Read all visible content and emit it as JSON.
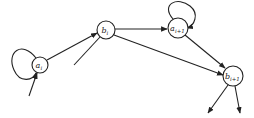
{
  "diagram": {
    "type": "directed-graph",
    "nodes": [
      {
        "id": "a_i",
        "label": "a",
        "subscript": "i",
        "cx": 40,
        "cy": 65,
        "r": 8,
        "self_loop": true
      },
      {
        "id": "b_i",
        "label": "b",
        "subscript": "i",
        "cx": 106,
        "cy": 30,
        "r": 9,
        "self_loop": false
      },
      {
        "id": "a_i+1",
        "label": "a",
        "subscript": "i+1",
        "cx": 178,
        "cy": 28,
        "r": 10,
        "self_loop": true
      },
      {
        "id": "b_i+1",
        "label": "b",
        "subscript": "i+1",
        "cx": 233,
        "cy": 76,
        "r": 10,
        "self_loop": false
      }
    ],
    "edges": [
      {
        "from": "a_i",
        "to": "b_i"
      },
      {
        "from": "b_i",
        "to": "a_i+1"
      },
      {
        "from": "b_i",
        "to": "b_i+1"
      },
      {
        "from": "a_i+1",
        "to": "b_i+1"
      },
      {
        "from": "external",
        "to": "a_i"
      },
      {
        "from": "external",
        "to": "b_i"
      },
      {
        "from": "b_i+1",
        "to": "external-1"
      },
      {
        "from": "b_i+1",
        "to": "external-2"
      }
    ],
    "colors": {
      "stroke": "#222222",
      "background": "#ffffff"
    }
  }
}
